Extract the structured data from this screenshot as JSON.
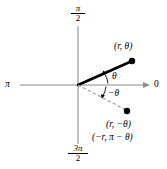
{
  "figure": {
    "kind": "polar-coordinate-diagram",
    "background_color": "#ffffff",
    "ink_color": "#000000",
    "axis_color": "#8c8c8c",
    "dashed_color": "#9a9a9a"
  },
  "axes": {
    "right_label": "0",
    "left_label": "π",
    "top_label": {
      "numerator": "π",
      "denominator": "2"
    },
    "bottom_label": {
      "numerator": "3π",
      "denominator": "2"
    }
  },
  "points": [
    {
      "name": "upper-point",
      "label": "(r, θ)"
    },
    {
      "name": "lower-point",
      "label_primary": "(r, −θ)",
      "label_secondary": "(−r, π − θ)"
    }
  ],
  "angles": [
    {
      "name": "theta",
      "label": "θ"
    },
    {
      "name": "negative-theta",
      "label": "−θ"
    }
  ],
  "geometry": {
    "origin_x": 78,
    "origin_y": 85,
    "upper_point_x": 132,
    "upper_point_y": 61,
    "lower_point_x": 127,
    "lower_point_y": 111
  }
}
